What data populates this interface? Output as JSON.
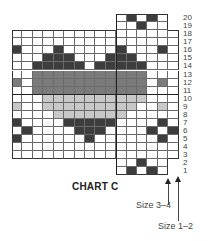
{
  "chart": {
    "title": "CHART C",
    "columns": 16,
    "rows": 20,
    "colors": {
      "D": "#3d3d3d",
      "M": "#7b7b7b",
      "L": "#c8c8c8",
      "W": "#ffffff"
    },
    "row_extent": {
      "1": [
        11,
        15
      ],
      "2": [
        11,
        15
      ],
      "3": [
        1,
        16
      ],
      "4": [
        1,
        16
      ],
      "5": [
        1,
        16
      ],
      "6": [
        1,
        16
      ],
      "7": [
        1,
        16
      ],
      "8": [
        1,
        16
      ],
      "9": [
        1,
        16
      ],
      "10": [
        1,
        16
      ],
      "11": [
        1,
        16
      ],
      "12": [
        1,
        16
      ],
      "13": [
        1,
        16
      ],
      "14": [
        1,
        16
      ],
      "15": [
        1,
        16
      ],
      "16": [
        1,
        16
      ],
      "17": [
        1,
        16
      ],
      "18": [
        1,
        16
      ],
      "19": [
        11,
        15
      ],
      "20": [
        11,
        15
      ]
    },
    "filled": {
      "20": {
        "D": [
          12,
          14
        ]
      },
      "19": {
        "D": [
          13
        ]
      },
      "16": {
        "D": [
          1,
          5,
          11,
          15
        ]
      },
      "15": {
        "D": [
          4,
          5,
          6,
          10,
          11,
          12
        ]
      },
      "14": {
        "D": [
          3,
          4,
          5,
          6,
          7,
          9,
          10,
          11,
          12,
          13
        ]
      },
      "13": {
        "M": [
          3,
          4,
          5,
          6,
          7,
          8,
          9,
          10,
          11,
          12,
          13
        ]
      },
      "12": {
        "M": [
          1,
          3,
          4,
          5,
          6,
          7,
          8,
          9,
          10,
          11,
          12,
          13,
          15
        ]
      },
      "11": {
        "M": [
          3,
          4,
          5,
          6,
          7,
          8,
          9,
          10,
          11,
          12,
          13
        ]
      },
      "10": {
        "L": [
          4,
          5,
          6,
          7,
          8,
          9,
          10,
          11,
          12,
          13
        ]
      },
      "9": {
        "L": [
          1,
          4,
          5,
          6,
          7,
          8,
          9,
          10,
          11,
          12,
          15
        ]
      },
      "8": {
        "L": [
          5,
          6,
          7,
          8,
          9,
          10,
          11
        ]
      },
      "7": {
        "D": [
          1,
          6,
          7,
          8,
          9,
          10,
          15
        ]
      },
      "6": {
        "D": [
          2,
          7,
          8,
          9,
          14,
          16
        ]
      },
      "5": {
        "D": [
          1,
          8,
          15
        ]
      },
      "2": {
        "D": [
          13
        ]
      },
      "1": {
        "D": [
          12,
          14
        ]
      }
    },
    "row_labels": [
      "1",
      "2",
      "3",
      "4",
      "5",
      "6",
      "7",
      "8",
      "9",
      "10",
      "11",
      "12",
      "13",
      "14",
      "15",
      "16",
      "17",
      "18",
      "19",
      "20"
    ]
  },
  "size_markers": [
    {
      "label": "Size 3–4",
      "column_edge": 15
    },
    {
      "label": "Size 1–2",
      "column_edge": 16
    }
  ]
}
